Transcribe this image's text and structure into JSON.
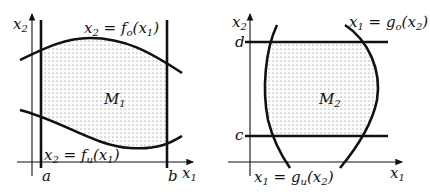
{
  "figure": {
    "left": {
      "region_label": "M",
      "region_sub": "1",
      "y_axis_label": "x",
      "y_axis_sub": "2",
      "x_axis_label": "x",
      "x_axis_sub": "1",
      "left_bound": "a",
      "right_bound": "b",
      "upper_curve": {
        "lhs": "x",
        "lhs_sub": "2",
        "eq": " = ",
        "fn": "f",
        "fn_sub": "o",
        "arg": "(x",
        "arg_sub": "1",
        "close": ")"
      },
      "lower_curve": {
        "lhs": "x",
        "lhs_sub": "2",
        "eq": " = ",
        "fn": "f",
        "fn_sub": "u",
        "arg": "(x",
        "arg_sub": "1",
        "close": ")"
      }
    },
    "right": {
      "region_label": "M",
      "region_sub": "2",
      "y_axis_label": "x",
      "y_axis_sub": "2",
      "x_axis_label": "x",
      "x_axis_sub": "1",
      "top_bound": "d",
      "bottom_bound": "c",
      "right_curve": {
        "lhs": "x",
        "lhs_sub": "1",
        "eq": " = ",
        "fn": "g",
        "fn_sub": "o",
        "arg": "(x",
        "arg_sub": "2",
        "close": ")"
      },
      "left_curve": {
        "lhs": "x",
        "lhs_sub": "1",
        "eq": " = ",
        "fn": "g",
        "fn_sub": "u",
        "arg": "(x",
        "arg_sub": "2",
        "close": ")"
      }
    },
    "colors": {
      "stroke": "#111111",
      "dots": "#555555",
      "background": "#ffffff"
    }
  }
}
